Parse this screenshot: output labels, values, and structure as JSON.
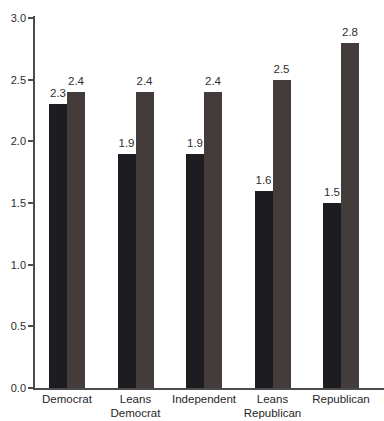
{
  "chart_data": {
    "type": "bar",
    "title": "",
    "xlabel": "",
    "ylabel": "",
    "categories": [
      "Democrat",
      "Leans Democrat",
      "Independent",
      "Leans Republican",
      "Republican"
    ],
    "series": [
      {
        "name": "series-dark",
        "color": "#1d1c21",
        "values": [
          2.3,
          1.9,
          1.9,
          1.6,
          1.5
        ]
      },
      {
        "name": "series-gray",
        "color": "#443b3b",
        "values": [
          2.4,
          2.4,
          2.4,
          2.5,
          2.8
        ]
      }
    ],
    "ylim": [
      0.0,
      3.0
    ],
    "yticks": [
      0.0,
      0.5,
      1.0,
      1.5,
      2.0,
      2.5,
      3.0
    ],
    "ytick_labels": [
      "0.0",
      "0.5",
      "1.0",
      "1.5",
      "2.0",
      "2.5",
      "3.0"
    ],
    "grid": false,
    "legend": "none",
    "value_labels": [
      "2.3",
      "2.4",
      "1.9",
      "2.4",
      "1.9",
      "2.4",
      "1.6",
      "2.5",
      "1.5",
      "2.8"
    ],
    "axis_color": "#4c4c4c",
    "text_color": "#2b2b2b",
    "background_color": "#ffffff"
  }
}
